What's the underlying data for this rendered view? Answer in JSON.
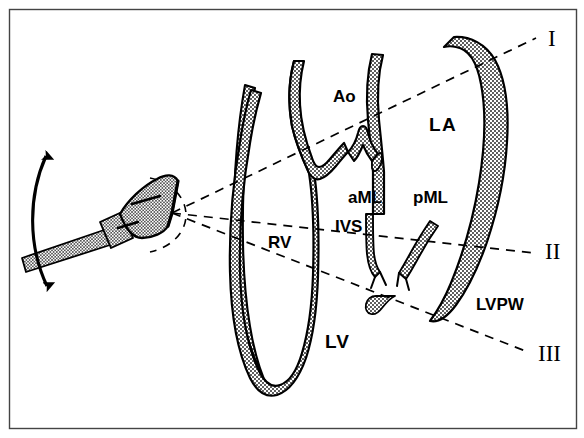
{
  "figure": {
    "background_color": "#ffffff",
    "ink_color": "#000000",
    "tissue_fill_color": "#d8d8d8",
    "frame": {
      "name": "figure-border",
      "x": 9,
      "y": 9,
      "width": 568,
      "height": 420,
      "stroke_width": 1.5
    }
  },
  "transducer": {
    "name": "ultrasound-transducer",
    "description": "stippled probe head with cable, placed at left chest",
    "head": {
      "cx": 131,
      "cy": 207,
      "angle_deg": -28
    },
    "cable_label": "transducer-cable",
    "sweep_arrow": {
      "name": "sweep-arrow",
      "description": "double-headed curved arrow showing angulation sweep",
      "top_point": {
        "x": 43,
        "y": 148
      },
      "bottom_point": {
        "x": 44,
        "y": 292
      }
    },
    "apex_point": {
      "x": 172,
      "y": 213
    },
    "beam_arc": {
      "name": "beam-arc",
      "description": "dashed arc at probe face"
    }
  },
  "scan_planes": [
    {
      "id": "I",
      "name": "scan-plane-I",
      "label": "I",
      "label_x": 548,
      "label_y": 46,
      "from": {
        "x": 172,
        "y": 213
      },
      "to": {
        "x": 536,
        "y": 38
      },
      "anatomy_crossed": "aortic root and left atrium"
    },
    {
      "id": "II",
      "name": "scan-plane-II",
      "label": "II",
      "label_x": 545,
      "label_y": 259,
      "from": {
        "x": 172,
        "y": 213
      },
      "to": {
        "x": 534,
        "y": 253
      },
      "anatomy_crossed": "mitral valve leaflets"
    },
    {
      "id": "III",
      "name": "scan-plane-III",
      "label": "III",
      "label_x": 540,
      "label_y": 361,
      "from": {
        "x": 172,
        "y": 213
      },
      "to": {
        "x": 528,
        "y": 352
      },
      "anatomy_crossed": "left ventricle below mitral valve"
    }
  ],
  "anatomy_labels": [
    {
      "name": "label-ao",
      "text": "Ao",
      "x": 333,
      "y": 102,
      "size": 17,
      "desc": "aorta / aortic root"
    },
    {
      "name": "label-la",
      "text": "LA",
      "x": 429,
      "y": 131,
      "size": 19,
      "desc": "left atrium"
    },
    {
      "name": "label-aml",
      "text": "aML",
      "x": 348,
      "y": 203,
      "size": 17,
      "desc": "anterior mitral leaflet"
    },
    {
      "name": "label-pml",
      "text": "pML",
      "x": 413,
      "y": 203,
      "size": 17,
      "desc": "posterior mitral leaflet"
    },
    {
      "name": "label-ivs",
      "text": "IVS",
      "x": 335,
      "y": 232,
      "size": 17,
      "desc": "interventricular septum"
    },
    {
      "name": "label-rv",
      "text": "RV",
      "x": 268,
      "y": 248,
      "size": 17,
      "desc": "right ventricle"
    },
    {
      "name": "label-lv",
      "text": "LV",
      "x": 325,
      "y": 348,
      "size": 19,
      "desc": "left ventricle"
    },
    {
      "name": "label-lvpw",
      "text": "LVPW",
      "x": 476,
      "y": 310,
      "size": 17,
      "desc": "left ventricular posterior wall"
    }
  ]
}
